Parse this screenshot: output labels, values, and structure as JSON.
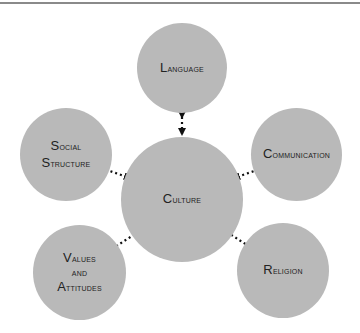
{
  "diagram": {
    "center": {
      "id": "culture",
      "lines": [
        "Culture"
      ]
    },
    "nodes": [
      {
        "id": "language",
        "lines": [
          "Language"
        ]
      },
      {
        "id": "social-structure",
        "lines": [
          "Social",
          "Structure"
        ]
      },
      {
        "id": "communication",
        "lines": [
          "Communication"
        ]
      },
      {
        "id": "values-and-attitudes",
        "lines": [
          "Values",
          "and",
          "Attitudes"
        ]
      },
      {
        "id": "religion",
        "lines": [
          "Religion"
        ]
      }
    ],
    "edges": [
      {
        "from": "language",
        "to": "culture",
        "style": "dotted",
        "arrows": "both"
      },
      {
        "from": "social-structure",
        "to": "culture",
        "style": "dotted",
        "arrows": "both"
      },
      {
        "from": "communication",
        "to": "culture",
        "style": "dotted",
        "arrows": "both"
      },
      {
        "from": "values-and-attitudes",
        "to": "culture",
        "style": "dotted",
        "arrows": "both"
      },
      {
        "from": "religion",
        "to": "culture",
        "style": "dotted",
        "arrows": "both"
      }
    ],
    "colors": {
      "circle": "#b9b9b9",
      "text": "#222222",
      "arrow": "#111111",
      "rule": "#8a8a8a"
    }
  }
}
